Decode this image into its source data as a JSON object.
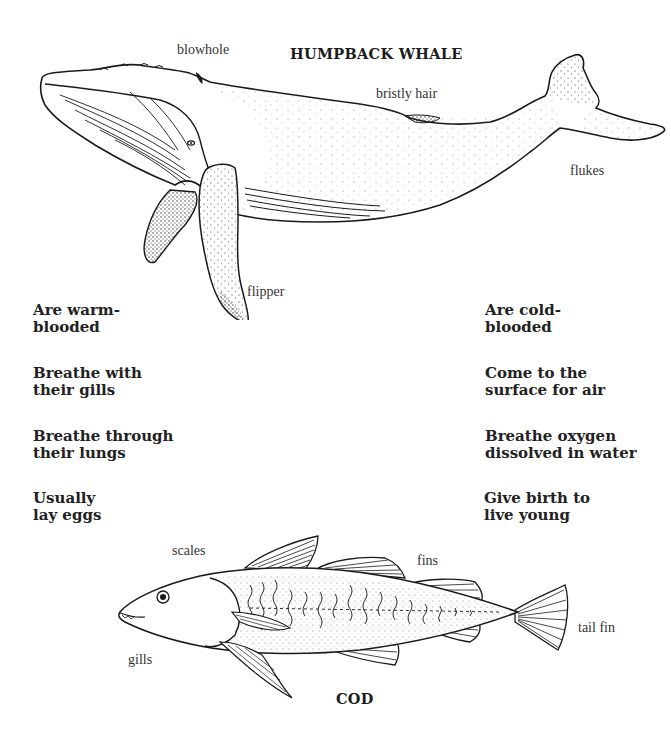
{
  "whale": {
    "title": "HUMPBACK WHALE",
    "labels": {
      "blowhole": "blowhole",
      "bristly_hair": "bristly hair",
      "flukes": "flukes",
      "flipper": "flipper"
    }
  },
  "cod": {
    "title": "COD",
    "labels": {
      "scales": "scales",
      "fins": "fins",
      "gills": "gills",
      "tail_fin": "tail fin"
    }
  },
  "facts": {
    "left": [
      {
        "line1": "Are warm-",
        "line2": "blooded"
      },
      {
        "line1": "Breathe with",
        "line2": "their gills"
      },
      {
        "line1": "Breathe through",
        "line2": "their lungs"
      },
      {
        "line1": "Usually",
        "line2": "lay eggs"
      }
    ],
    "right": [
      {
        "line1": "Are cold-",
        "line2": "blooded"
      },
      {
        "line1": "Come to the",
        "line2": "surface for air"
      },
      {
        "line1": "Breathe oxygen",
        "line2": "dissolved in water"
      },
      {
        "line1": "Give birth to",
        "line2": "live young"
      }
    ]
  },
  "colors": {
    "ink": "#1a1a1a",
    "label": "#333333",
    "background": "#ffffff"
  }
}
